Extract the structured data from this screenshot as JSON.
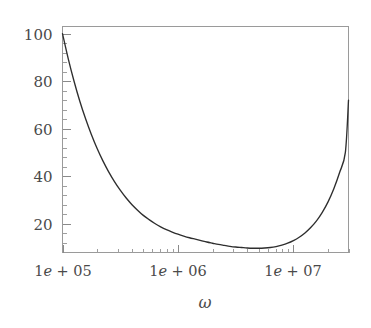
{
  "chart_data": {
    "type": "line",
    "title": "",
    "subtitle": "",
    "xlabel": "ω",
    "ylabel": "",
    "xscale": "log",
    "yscale": "linear",
    "grid": false,
    "legend": null,
    "xlim": [
      100000,
      30000000
    ],
    "ylim": [
      8,
      103
    ],
    "x_tick_labels": [
      "1e + 05",
      "1e + 06",
      "1e + 07"
    ],
    "x_tick_values": [
      100000,
      1000000,
      10000000
    ],
    "y_tick_labels": [
      "100",
      "80",
      "60",
      "40",
      "20"
    ],
    "y_tick_values": [
      100,
      80,
      60,
      40,
      20
    ],
    "y_minor_tick_count_between": 4,
    "x_minor_tick_decade_multipliers": [
      2,
      3,
      4,
      5,
      6,
      7,
      8,
      9
    ],
    "series": [
      {
        "name": "curve",
        "color": "#2e2e2e",
        "x": [
          100000,
          112202,
          125893,
          141254,
          158489,
          177828,
          199526,
          223872,
          251189,
          281838,
          316228,
          354813,
          398107,
          446684,
          501187,
          562341,
          630957,
          707946,
          794328,
          891251,
          1000000,
          1122018,
          1258925,
          1412538,
          1584893,
          1778279,
          1995262,
          2238721,
          2511886,
          2818383,
          3162278,
          3548134,
          3981072,
          4466836,
          5011872,
          5623413,
          6309573,
          7079458,
          7943282,
          8912509,
          10000000,
          11220185,
          12589254,
          14125375,
          15848932,
          17782794,
          19952623,
          22387211,
          25118864,
          28183829,
          30000000
        ],
        "y": [
          100.0,
          89.4,
          80.0,
          71.6,
          64.2,
          57.6,
          51.7,
          46.5,
          41.9,
          37.8,
          34.2,
          31.0,
          28.2,
          25.8,
          23.6,
          21.8,
          20.2,
          18.8,
          17.6,
          16.6,
          15.7,
          14.9,
          14.2,
          13.6,
          13.0,
          12.4,
          11.9,
          11.4,
          11.0,
          10.6,
          10.3,
          10.1,
          9.9,
          9.8,
          9.8,
          9.9,
          10.1,
          10.5,
          11.1,
          11.9,
          13.0,
          14.4,
          16.2,
          18.5,
          21.3,
          24.9,
          29.3,
          34.8,
          41.6,
          50.1,
          72.0
        ]
      }
    ],
    "annotations": []
  },
  "axis": {
    "y_labels": [
      "100",
      "80",
      "60",
      "40",
      "20"
    ],
    "x_labels": [
      {
        "prefix": "1",
        "e": "e",
        "suffix": "+ 05"
      },
      {
        "prefix": "1",
        "e": "e",
        "suffix": "+ 06"
      },
      {
        "prefix": "1",
        "e": "e",
        "suffix": "+ 07"
      }
    ],
    "x_title": "ω"
  },
  "style": {
    "background": "#ffffff",
    "frame_color": "#9a9a9a",
    "tick_color": "#8a8a8a",
    "text_color": "#4a4a4a",
    "curve_color": "#2e2e2e"
  }
}
